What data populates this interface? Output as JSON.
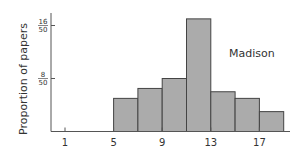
{
  "chart_data": {
    "type": "bar",
    "title": "",
    "annotation": "Madison",
    "xlabel": "",
    "ylabel": "Proportion of papers",
    "x_ticks": [
      1,
      5,
      9,
      13,
      17
    ],
    "x_tick_labels": [
      "1",
      "5",
      "9",
      "13",
      "17"
    ],
    "y_ticks": [
      {
        "value": 0.32,
        "numerator": "16",
        "denominator": "50"
      },
      {
        "value": 0.16,
        "numerator": "8",
        "denominator": "50"
      }
    ],
    "xlim": [
      0,
      19.5
    ],
    "ylim": [
      0,
      0.36
    ],
    "bin_width": 2,
    "bins": [
      {
        "x_start": 5,
        "x_end": 7,
        "value": 0.1
      },
      {
        "x_start": 7,
        "x_end": 9,
        "value": 0.13
      },
      {
        "x_start": 9,
        "x_end": 11,
        "value": 0.16
      },
      {
        "x_start": 11,
        "x_end": 13,
        "value": 0.34
      },
      {
        "x_start": 13,
        "x_end": 15,
        "value": 0.12
      },
      {
        "x_start": 15,
        "x_end": 17,
        "value": 0.1
      },
      {
        "x_start": 17,
        "x_end": 19,
        "value": 0.06
      }
    ],
    "grid": false,
    "legend": "none",
    "colors": {
      "bar_fill": "#ababab",
      "bar_stroke": "#444444",
      "axis": "#555555"
    }
  }
}
